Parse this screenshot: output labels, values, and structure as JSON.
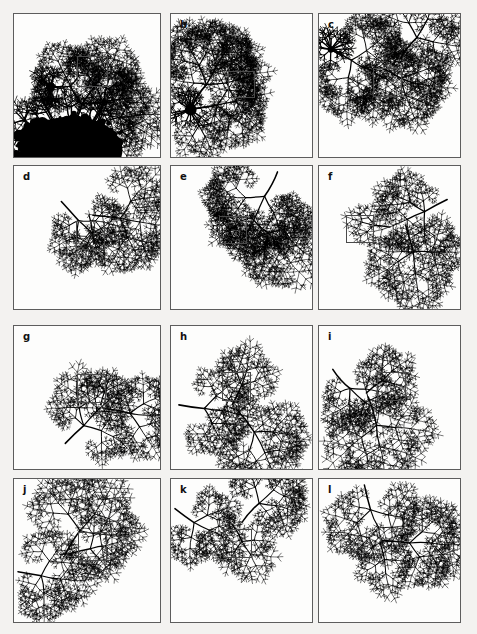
{
  "figure": {
    "type": "mandelbrot-zoom-sequence",
    "columns": 3,
    "rows": 4,
    "background_color": "#f3f2f0",
    "panel_background_color": "#fdfdfc",
    "panel_border_color": "#5d5d5d",
    "fractal_color": "#000000",
    "zoom_box_color": "#4a4a4a",
    "panel_width": 148,
    "panel_height": 145,
    "panels": [
      {
        "label": "a",
        "label_visible": false,
        "x": 13,
        "y": 13,
        "w": 148,
        "h": 145,
        "has_zoom_box": true,
        "zoom_box": {
          "x": 63,
          "y": 42,
          "w": 31,
          "h": 31
        },
        "has_bulb": true,
        "bulb": {
          "cx": 58,
          "cy": 138,
          "rx": 52,
          "ry": 34
        },
        "seed": 11,
        "trunk": {
          "x": 55,
          "y": 120,
          "angle": -64,
          "length": 34,
          "depth": 8,
          "width": 2.2
        },
        "branches": [
          {
            "x": 55,
            "y": 120,
            "angle": -64,
            "length": 32,
            "depth": 8,
            "width": 2.0
          },
          {
            "x": 56,
            "y": 119,
            "angle": -16,
            "length": 30,
            "depth": 7,
            "width": 1.8
          }
        ],
        "node": {
          "cx": 37,
          "cy": 74,
          "r": 4.6
        }
      },
      {
        "label": "b",
        "label_visible": true,
        "x": 170,
        "y": 13,
        "w": 143,
        "h": 145,
        "has_zoom_box": true,
        "zoom_box": {
          "x": 57,
          "y": 57,
          "w": 27,
          "h": 27
        },
        "has_bulb": false,
        "seed": 23,
        "trunk": {
          "x": 20,
          "y": 97,
          "angle": -58,
          "length": 30,
          "depth": 8,
          "width": 1.9
        },
        "branches": [
          {
            "x": 20,
            "y": 97,
            "angle": -58,
            "length": 30,
            "depth": 8,
            "width": 1.8
          },
          {
            "x": 21,
            "y": 96,
            "angle": -8,
            "length": 26,
            "depth": 7,
            "width": 1.6
          },
          {
            "x": 19,
            "y": 99,
            "angle": 56,
            "length": 17,
            "depth": 6,
            "width": 1.4
          }
        ],
        "node": {
          "cx": 20,
          "cy": 97,
          "r": 6.0
        }
      },
      {
        "label": "c",
        "label_visible": true,
        "x": 318,
        "y": 13,
        "w": 143,
        "h": 145,
        "has_zoom_box": true,
        "zoom_box": {
          "x": 54,
          "y": 54,
          "w": 29,
          "h": 29
        },
        "has_bulb": false,
        "seed": 37,
        "trunk": {
          "x": 8,
          "y": 30,
          "angle": 34,
          "length": 30,
          "depth": 8,
          "width": 1.7
        },
        "branches": [
          {
            "x": 8,
            "y": 30,
            "angle": 34,
            "length": 30,
            "depth": 8,
            "width": 1.6
          },
          {
            "x": 82,
            "y": 46,
            "angle": -52,
            "length": 28,
            "depth": 7,
            "width": 1.6
          },
          {
            "x": 62,
            "y": 54,
            "angle": 28,
            "length": 24,
            "depth": 7,
            "width": 1.5
          }
        ],
        "node": {
          "cx": 12,
          "cy": 36,
          "r": 3.2
        }
      },
      {
        "label": "d",
        "label_visible": true,
        "x": 13,
        "y": 165,
        "w": 148,
        "h": 145,
        "has_zoom_box": true,
        "zoom_box": {
          "x": 62,
          "y": 55,
          "w": 29,
          "h": 29
        },
        "has_bulb": false,
        "seed": 51,
        "trunk": {
          "x": 48,
          "y": 36,
          "angle": 48,
          "length": 26,
          "depth": 7,
          "width": 1.6
        },
        "branches": [
          {
            "x": 48,
            "y": 36,
            "angle": 48,
            "length": 26,
            "depth": 7,
            "width": 1.6
          },
          {
            "x": 80,
            "y": 50,
            "angle": 6,
            "length": 28,
            "depth": 7,
            "width": 1.5
          },
          {
            "x": 76,
            "y": 50,
            "angle": 78,
            "length": 14,
            "depth": 5,
            "width": 1.3
          }
        ],
        "node": null
      },
      {
        "label": "e",
        "label_visible": true,
        "x": 170,
        "y": 165,
        "w": 143,
        "h": 145,
        "has_zoom_box": true,
        "zoom_box": {
          "x": 48,
          "y": 50,
          "w": 28,
          "h": 28
        },
        "has_bulb": false,
        "seed": 67,
        "trunk": {
          "x": 108,
          "y": 6,
          "angle": 118,
          "length": 28,
          "depth": 8,
          "width": 1.6
        },
        "branches": [
          {
            "x": 108,
            "y": 6,
            "angle": 118,
            "length": 28,
            "depth": 8,
            "width": 1.6
          },
          {
            "x": 80,
            "y": 50,
            "angle": 44,
            "length": 26,
            "depth": 7,
            "width": 1.5
          },
          {
            "x": 70,
            "y": 58,
            "angle": 150,
            "length": 12,
            "depth": 5,
            "width": 1.3
          }
        ],
        "node": null
      },
      {
        "label": "f",
        "label_visible": true,
        "x": 318,
        "y": 165,
        "w": 143,
        "h": 145,
        "has_zoom_box": true,
        "zoom_box": {
          "x": 27,
          "y": 49,
          "w": 28,
          "h": 28
        },
        "has_bulb": false,
        "seed": 83,
        "trunk": {
          "x": 130,
          "y": 34,
          "angle": 152,
          "length": 26,
          "depth": 7,
          "width": 1.6
        },
        "branches": [
          {
            "x": 130,
            "y": 34,
            "angle": 152,
            "length": 26,
            "depth": 7,
            "width": 1.6
          },
          {
            "x": 88,
            "y": 60,
            "angle": 74,
            "length": 28,
            "depth": 7,
            "width": 1.5
          },
          {
            "x": 72,
            "y": 62,
            "angle": 186,
            "length": 16,
            "depth": 5,
            "width": 1.3
          }
        ],
        "node": null
      },
      {
        "label": "g",
        "label_visible": true,
        "x": 13,
        "y": 325,
        "w": 148,
        "h": 145,
        "has_zoom_box": true,
        "zoom_box": {
          "x": 63,
          "y": 48,
          "w": 29,
          "h": 29
        },
        "has_bulb": false,
        "seed": 97,
        "trunk": {
          "x": 52,
          "y": 119,
          "angle": -44,
          "length": 26,
          "depth": 7,
          "width": 1.6
        },
        "branches": [
          {
            "x": 52,
            "y": 119,
            "angle": -44,
            "length": 26,
            "depth": 7,
            "width": 1.6
          },
          {
            "x": 92,
            "y": 84,
            "angle": 10,
            "length": 26,
            "depth": 7,
            "width": 1.5
          },
          {
            "x": 88,
            "y": 80,
            "angle": -74,
            "length": 14,
            "depth": 5,
            "width": 1.3
          }
        ],
        "node": null
      },
      {
        "label": "h",
        "label_visible": true,
        "x": 170,
        "y": 325,
        "w": 143,
        "h": 145,
        "has_zoom_box": true,
        "zoom_box": {
          "x": 51,
          "y": 46,
          "w": 29,
          "h": 29
        },
        "has_bulb": false,
        "seed": 113,
        "trunk": {
          "x": 8,
          "y": 80,
          "angle": 8,
          "length": 26,
          "depth": 7,
          "width": 1.6
        },
        "branches": [
          {
            "x": 8,
            "y": 80,
            "angle": 8,
            "length": 26,
            "depth": 7,
            "width": 1.6
          },
          {
            "x": 62,
            "y": 80,
            "angle": -64,
            "length": 22,
            "depth": 6,
            "width": 1.4
          },
          {
            "x": 66,
            "y": 84,
            "angle": 52,
            "length": 30,
            "depth": 7,
            "width": 1.5
          }
        ],
        "node": null
      },
      {
        "label": "i",
        "label_visible": true,
        "x": 318,
        "y": 325,
        "w": 143,
        "h": 145,
        "has_zoom_box": true,
        "zoom_box": {
          "x": 58,
          "y": 46,
          "w": 29,
          "h": 29
        },
        "has_bulb": false,
        "seed": 131,
        "trunk": {
          "x": 14,
          "y": 44,
          "angle": 48,
          "length": 26,
          "depth": 7,
          "width": 1.6
        },
        "branches": [
          {
            "x": 14,
            "y": 44,
            "angle": 48,
            "length": 26,
            "depth": 7,
            "width": 1.6
          },
          {
            "x": 48,
            "y": 68,
            "angle": -38,
            "length": 20,
            "depth": 6,
            "width": 1.4
          },
          {
            "x": 50,
            "y": 72,
            "angle": 74,
            "length": 30,
            "depth": 7,
            "width": 1.5
          }
        ],
        "node": null
      },
      {
        "label": "j",
        "label_visible": true,
        "x": 13,
        "y": 478,
        "w": 148,
        "h": 145,
        "has_zoom_box": true,
        "zoom_box": {
          "x": 64,
          "y": 53,
          "w": 29,
          "h": 29
        },
        "has_bulb": false,
        "seed": 149,
        "trunk": {
          "x": 4,
          "y": 94,
          "angle": 10,
          "length": 24,
          "depth": 7,
          "width": 1.6
        },
        "branches": [
          {
            "x": 4,
            "y": 94,
            "angle": 10,
            "length": 24,
            "depth": 7,
            "width": 1.5
          },
          {
            "x": 52,
            "y": 76,
            "angle": -58,
            "length": 28,
            "depth": 7,
            "width": 1.5
          },
          {
            "x": 56,
            "y": 76,
            "angle": -14,
            "length": 22,
            "depth": 6,
            "width": 1.4
          }
        ],
        "node": null
      },
      {
        "label": "k",
        "label_visible": true,
        "x": 170,
        "y": 478,
        "w": 143,
        "h": 145,
        "has_zoom_box": true,
        "zoom_box": {
          "x": 52,
          "y": 50,
          "w": 29,
          "h": 29
        },
        "has_bulb": false,
        "seed": 167,
        "trunk": {
          "x": 4,
          "y": 30,
          "angle": 36,
          "length": 24,
          "depth": 7,
          "width": 1.5
        },
        "branches": [
          {
            "x": 4,
            "y": 30,
            "angle": 36,
            "length": 24,
            "depth": 7,
            "width": 1.5
          },
          {
            "x": 72,
            "y": 44,
            "angle": -48,
            "length": 26,
            "depth": 7,
            "width": 1.5
          },
          {
            "x": 62,
            "y": 46,
            "angle": 60,
            "length": 20,
            "depth": 6,
            "width": 1.4
          }
        ],
        "node": null
      },
      {
        "label": "l",
        "label_visible": true,
        "x": 318,
        "y": 478,
        "w": 143,
        "h": 145,
        "has_zoom_box": false,
        "zoom_box": null,
        "has_bulb": false,
        "seed": 181,
        "trunk": {
          "x": 46,
          "y": 6,
          "angle": 76,
          "length": 26,
          "depth": 7,
          "width": 1.5
        },
        "branches": [
          {
            "x": 46,
            "y": 6,
            "angle": 76,
            "length": 26,
            "depth": 7,
            "width": 1.5
          },
          {
            "x": 64,
            "y": 62,
            "angle": 6,
            "length": 28,
            "depth": 7,
            "width": 1.5
          },
          {
            "x": 62,
            "y": 64,
            "angle": 76,
            "length": 18,
            "depth": 6,
            "width": 1.3
          }
        ],
        "node": null
      }
    ]
  }
}
